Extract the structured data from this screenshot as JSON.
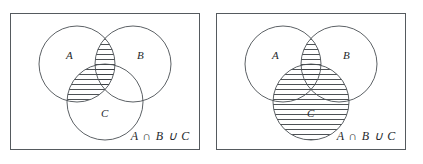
{
  "figure": {
    "background_color": "#ffffff",
    "stroke_color": "#4a4f54",
    "frame_color": "#555a5e",
    "hatch_color": "#3a3e42"
  },
  "panels": [
    {
      "id": "left",
      "caption": "A ∩ B ∪ C",
      "labels": {
        "a": "A",
        "b": "B",
        "c": "C"
      },
      "shaded_regions": [
        "A∩B",
        "A∩C"
      ],
      "description": "Three-circle Venn diagram with the A-intersect-B lens and the A-intersect-C lens hatched."
    },
    {
      "id": "right",
      "caption": "A ∩ B ∪ C",
      "labels": {
        "a": "A",
        "b": "B",
        "c": "C"
      },
      "shaded_regions": [
        "A∩B",
        "C"
      ],
      "description": "Three-circle Venn diagram with the A-intersect-B lens and the whole circle C hatched."
    }
  ],
  "geometry": {
    "circle_radius": 38,
    "circle_a": {
      "cx": 66,
      "cy": 50
    },
    "circle_b": {
      "cx": 122,
      "cy": 50
    },
    "circle_c": {
      "cx": 94,
      "cy": 88
    },
    "label_a": {
      "x": 55,
      "y": 45
    },
    "label_b": {
      "x": 126,
      "y": 45
    },
    "label_c": {
      "x": 92,
      "y": 102
    },
    "hatch_spacing": 5
  }
}
